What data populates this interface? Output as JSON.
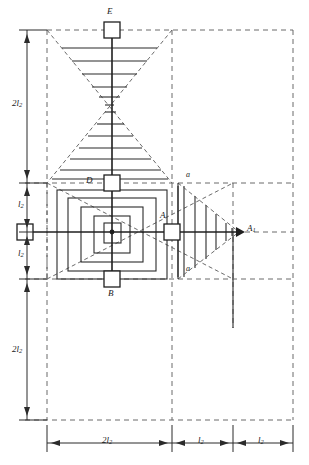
{
  "figure": {
    "kind": "structural-influence-diagram",
    "background": "#ffffff",
    "line_color": "#2b2b2b",
    "dash_color": "#555555",
    "hatch_color": "#3a3a3a",
    "width": 309,
    "height": 465
  },
  "nodes": {
    "E": {
      "label": "E",
      "x": 112,
      "y": 30,
      "box": 16
    },
    "D": {
      "label": "D",
      "x": 112,
      "y": 183,
      "box": 16
    },
    "A": {
      "label": "A",
      "x": 172,
      "y": 232,
      "box": 16
    },
    "B": {
      "label": "B",
      "x": 112,
      "y": 279,
      "box": 16
    },
    "A1": {
      "label": "A",
      "sub": "1",
      "x": 239,
      "y": 232
    },
    "left_support": {
      "label": "",
      "x": 25,
      "y": 232,
      "box": 16
    }
  },
  "section_marks": [
    {
      "label": "a",
      "x": 186,
      "y": 178
    },
    {
      "label": "a",
      "x": 186,
      "y": 268
    }
  ],
  "dimensions": {
    "vertical": [
      {
        "label": "2l",
        "sub": "2",
        "from_y": 30,
        "to_y": 183,
        "text": "2l2"
      },
      {
        "label": "l",
        "sub": "2",
        "from_y": 183,
        "to_y": 232,
        "text": "l2"
      },
      {
        "label": "l",
        "sub": "2",
        "from_y": 232,
        "to_y": 279,
        "text": "l2"
      },
      {
        "label": "2l",
        "sub": "2",
        "from_y": 279,
        "to_y": 420,
        "text": "2l2"
      }
    ],
    "horizontal": [
      {
        "label": "2l",
        "sub": "2",
        "from_x": 47,
        "to_x": 172,
        "text": "2l2"
      },
      {
        "label": "l",
        "sub": "2",
        "from_x": 172,
        "to_x": 233,
        "text": "l2"
      },
      {
        "label": "l",
        "sub": "2",
        "from_x": 233,
        "to_x": 293,
        "text": "l2"
      }
    ]
  },
  "grid": {
    "vertical_dashed_x": [
      47,
      172,
      233,
      293
    ],
    "horizontal_dashed_y": [
      30,
      183,
      232,
      279,
      420
    ]
  },
  "hatch": {
    "upper_triangle_rungs": 6,
    "lower_triangle_rungs": 7,
    "right_triangle_rungs": 6,
    "nested_rect_count": 4
  }
}
